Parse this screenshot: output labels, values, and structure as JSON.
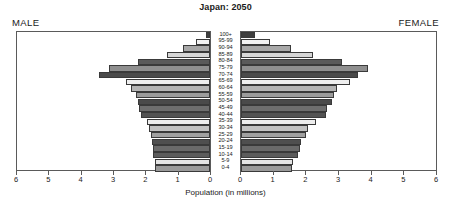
{
  "chart_data": {
    "type": "bar",
    "subtype": "population-pyramid",
    "title": "Japan: 2050",
    "xlabel": "Population (in millions)",
    "ylabel": "",
    "grid": false,
    "legend_position": "none",
    "left_panel_label": "MALE",
    "right_panel_label": "FEMALE",
    "xlim": [
      0,
      6
    ],
    "xticks": [
      0,
      1,
      2,
      3,
      4,
      5,
      6
    ],
    "left_tick_labels": [
      "6",
      "5",
      "4",
      "3",
      "2",
      "1",
      "0"
    ],
    "right_tick_labels": [
      "0",
      "1",
      "2",
      "3",
      "4",
      "5",
      "6"
    ],
    "categories": [
      "100+",
      "95-99",
      "90-94",
      "85-89",
      "80-84",
      "75-79",
      "70-74",
      "65-69",
      "60-64",
      "55-59",
      "50-54",
      "45-49",
      "40-44",
      "35-39",
      "30-34",
      "25-29",
      "20-24",
      "15-19",
      "10-14",
      "5-9",
      "0-4"
    ],
    "series": [
      {
        "name": "MALE",
        "side": "left",
        "values": [
          0.12,
          0.45,
          0.85,
          1.35,
          2.25,
          3.15,
          3.45,
          2.6,
          2.45,
          2.3,
          2.25,
          2.2,
          2.15,
          1.95,
          1.9,
          1.85,
          1.8,
          1.78,
          1.78,
          1.72,
          1.72
        ]
      },
      {
        "name": "FEMALE",
        "side": "right",
        "values": [
          0.42,
          0.9,
          1.55,
          2.2,
          3.1,
          3.9,
          3.6,
          3.35,
          2.95,
          2.85,
          2.8,
          2.65,
          2.6,
          2.3,
          2.05,
          2.0,
          1.85,
          1.8,
          1.75,
          1.6,
          1.58
        ]
      }
    ],
    "bar_fills": [
      "#3f3f3f",
      "#f2f2f2",
      "#a8a8a8",
      "#d6d6d6",
      "#5a5a5a",
      "#8f8f8f",
      "#4a4a4a",
      "#efefef",
      "#b5b5b5",
      "#9b9b9b",
      "#4a4a4a",
      "#6e6e6e",
      "#535353",
      "#ededed",
      "#c2c2c2",
      "#a0a0a0",
      "#4f4f4f",
      "#6a6a6a",
      "#5c5c5c",
      "#e4e4e4",
      "#9a9a9a"
    ]
  }
}
